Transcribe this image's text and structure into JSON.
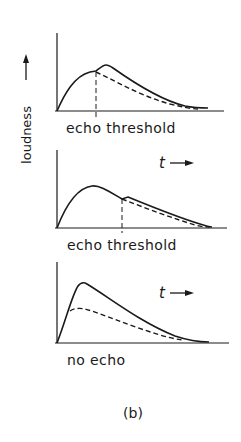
{
  "figure": {
    "y_axis_label": "loudness",
    "time_label": "t",
    "caption": "(b)",
    "colors": {
      "ink": "#1a1a1a",
      "background": "#ffffff"
    }
  },
  "panels": [
    {
      "id": "panel-1",
      "label": "echo threshold",
      "has_threshold_marker": true,
      "has_time_arrow": false,
      "description": "Solid curve rises to a shoulder at the echo threshold, then a secondary peak; dashed curve (direct sound) decays from threshold"
    },
    {
      "id": "panel-2",
      "label": "echo threshold",
      "has_threshold_marker": true,
      "has_time_arrow": true,
      "description": "Solid curve peaks early, small bump at echo threshold; dashed curve slightly below after threshold"
    },
    {
      "id": "panel-3",
      "label": "no echo",
      "has_threshold_marker": false,
      "has_time_arrow": true,
      "description": "Solid curve sharp high peak; dashed curve lower plateau; both decay"
    }
  ]
}
